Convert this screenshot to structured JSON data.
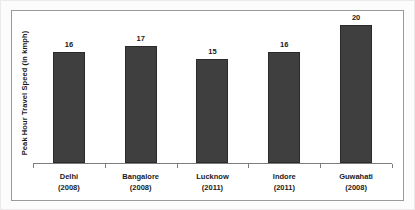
{
  "chart_data": {
    "type": "bar",
    "title": "",
    "subtitle": "",
    "xlabel": "",
    "ylabel": "Peak Hour Travel Speed  (in kmph)",
    "ylim": [
      0,
      22
    ],
    "grid": false,
    "legend": null,
    "categories": [
      "Delhi",
      "Bangalore",
      "Lucknow",
      "Indore",
      "Guwahati"
    ],
    "category_years": [
      "(2008)",
      "(2008)",
      "(2011)",
      "(2011)",
      "(2008)"
    ],
    "values": [
      16,
      17,
      15,
      16,
      20
    ],
    "value_labels": [
      "16",
      "17",
      "15",
      "16",
      "20"
    ],
    "bar_color": "#3f3f3f",
    "bar_border_color": "#2a2a2a",
    "axis_color": "#7d7d7d",
    "frame_color": "#9a9a9a",
    "text_color": "#1a1a1a",
    "background_color": "#ffffff"
  }
}
